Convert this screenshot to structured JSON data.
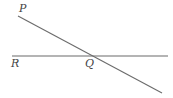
{
  "diagram": {
    "type": "intersecting-lines",
    "colors": {
      "line": "#6b6b6b",
      "label": "#444444",
      "background": "#ffffff"
    },
    "points": {
      "P": {
        "label": "P",
        "x": 21,
        "y": 11
      },
      "Q": {
        "label": "Q",
        "x": 89,
        "y": 67
      },
      "R": {
        "label": "R",
        "x": 14,
        "y": 67
      }
    },
    "lines": [
      {
        "name": "horizontal-line",
        "from": [
          12,
          56
        ],
        "to": [
          168,
          56
        ]
      },
      {
        "name": "transversal-line",
        "from": [
          18,
          16
        ],
        "to": [
          162,
          93
        ]
      }
    ]
  }
}
